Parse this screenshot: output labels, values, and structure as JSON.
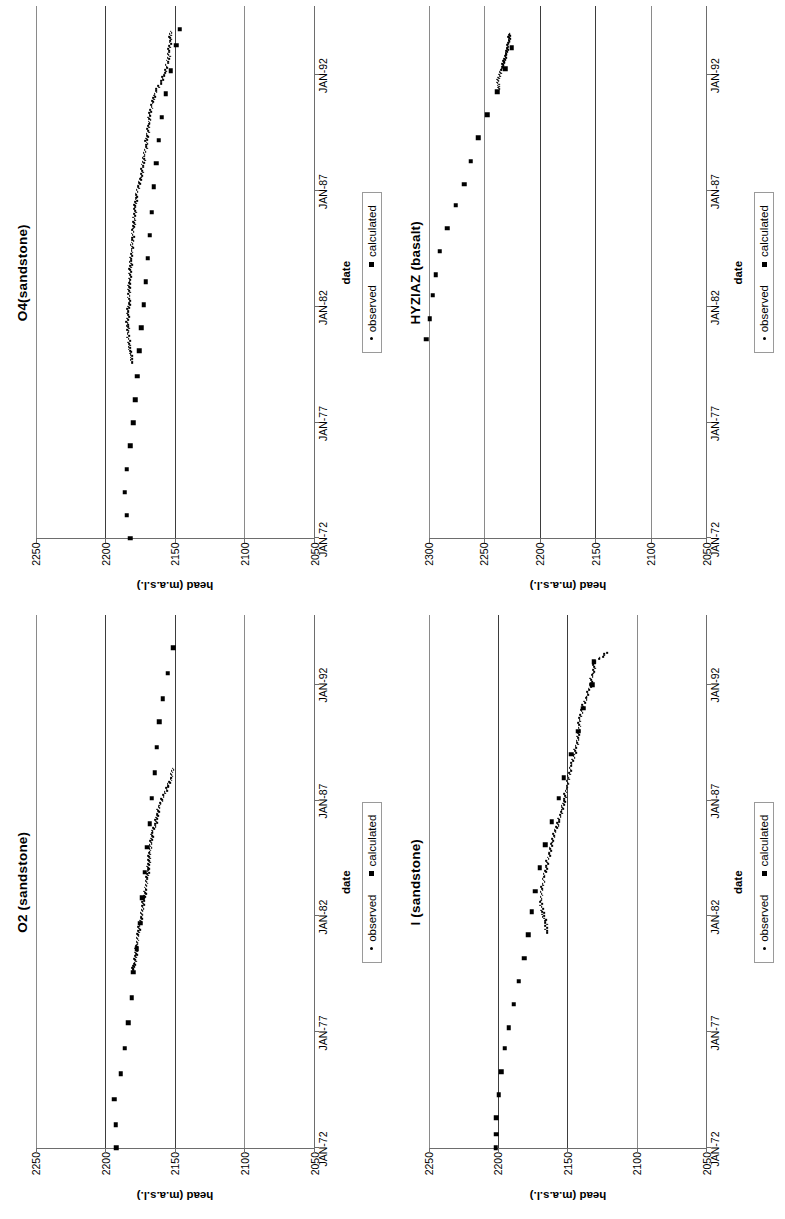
{
  "figure": {
    "panel_order": [
      "O2",
      "I",
      "O4",
      "HYZIAZ"
    ],
    "legend": {
      "observed_label": "observed",
      "calculated_label": "calculated"
    },
    "axis": {
      "xlabel": "date",
      "ylabel": "head (m.a.s.l.)"
    }
  },
  "chart_data": [
    {
      "id": "O2",
      "type": "scatter",
      "title": "O2 (sandstone)",
      "xlabel": "date",
      "ylabel": "head (m.a.s.l.)",
      "xticklabels": [
        "JAN-72",
        "JAN-77",
        "JAN-82",
        "JAN-87",
        "JAN-92"
      ],
      "xtickvalues": [
        1972,
        1977,
        1982,
        1987,
        1992
      ],
      "xlim": [
        1972,
        1995
      ],
      "yticklabels": [
        "2050",
        "2100",
        "2150",
        "2200",
        "2250"
      ],
      "ylim": [
        2050,
        2250
      ],
      "grid": "horizontal",
      "legend_position": "bottom",
      "series": [
        {
          "name": "calculated",
          "marker": "square",
          "x": [
            1972.0,
            1973.0,
            1974.1,
            1975.2,
            1976.3,
            1977.4,
            1978.5,
            1979.6,
            1980.6,
            1981.7,
            1982.8,
            1983.9,
            1985.0,
            1986.0,
            1987.1,
            1988.2,
            1989.3,
            1990.4,
            1991.4,
            1992.5,
            1993.6
          ],
          "y": [
            2192.0,
            2192.5,
            2193.5,
            2189.0,
            2186.0,
            2183.5,
            2181.0,
            2180.0,
            2177.5,
            2175.0,
            2173.5,
            2171.5,
            2170.0,
            2168.0,
            2166.5,
            2164.5,
            2163.0,
            2161.0,
            2158.5,
            2155.0,
            2151.0
          ]
        },
        {
          "name": "observed",
          "marker": "dot",
          "x": [
            1979.7,
            1980.0,
            1980.4,
            1980.8,
            1981.2,
            1981.6,
            1982.0,
            1982.4,
            1982.8,
            1983.2,
            1983.6,
            1984.0,
            1984.4,
            1984.8,
            1985.2,
            1985.6,
            1986.0,
            1986.4,
            1986.8,
            1987.2,
            1987.6,
            1988.0,
            1988.4
          ],
          "y": [
            2180.0,
            2179.0,
            2178.0,
            2177.2,
            2176.4,
            2175.2,
            2174.2,
            2173.2,
            2172.0,
            2171.0,
            2170.0,
            2169.4,
            2168.6,
            2168.0,
            2167.0,
            2166.2,
            2164.0,
            2162.5,
            2161.0,
            2158.0,
            2155.0,
            2152.5,
            2151.5
          ]
        }
      ]
    },
    {
      "id": "I",
      "type": "scatter",
      "title": "I (sandstone)",
      "xlabel": "date",
      "ylabel": "head (m.a.s.l.)",
      "xticklabels": [
        "JAN-72",
        "JAN-77",
        "JAN-82",
        "JAN-87",
        "JAN-92"
      ],
      "xtickvalues": [
        1972,
        1977,
        1982,
        1987,
        1992
      ],
      "xlim": [
        1972,
        1995
      ],
      "yticklabels": [
        "2050",
        "2100",
        "2150",
        "2200",
        "2250"
      ],
      "ylim": [
        2050,
        2250
      ],
      "grid": "horizontal",
      "legend_position": "bottom",
      "series": [
        {
          "name": "calculated",
          "marker": "square",
          "x": [
            1972.0,
            1972.6,
            1973.3,
            1974.3,
            1975.3,
            1976.3,
            1977.2,
            1978.2,
            1979.2,
            1980.2,
            1981.2,
            1982.2,
            1983.1,
            1984.1,
            1985.1,
            1986.1,
            1987.1,
            1988.0,
            1989.0,
            1990.0,
            1991.0,
            1992.0,
            1993.0
          ],
          "y": [
            2201.5,
            2201.0,
            2201.0,
            2199.5,
            2197.5,
            2195.0,
            2192.0,
            2188.5,
            2185.0,
            2181.0,
            2178.0,
            2175.5,
            2173.0,
            2170.0,
            2166.0,
            2161.0,
            2156.0,
            2152.5,
            2147.0,
            2142.0,
            2138.5,
            2132.0,
            2131.0
          ]
        },
        {
          "name": "observed",
          "marker": "dot",
          "x": [
            1981.3,
            1981.8,
            1982.2,
            1982.7,
            1983.2,
            1983.7,
            1984.2,
            1984.7,
            1985.2,
            1985.7,
            1986.1,
            1986.6,
            1987.0,
            1987.5,
            1988.0,
            1988.5,
            1989.0,
            1989.5,
            1990.0,
            1990.5,
            1991.0,
            1991.5,
            1992.0,
            1992.5,
            1993.0,
            1993.4
          ],
          "y": [
            2164.5,
            2166.0,
            2168.0,
            2169.0,
            2168.0,
            2166.5,
            2165.0,
            2163.0,
            2161.0,
            2158.5,
            2156.0,
            2154.0,
            2152.0,
            2150.5,
            2149.0,
            2147.0,
            2145.0,
            2143.0,
            2141.5,
            2141.0,
            2139.0,
            2136.0,
            2133.5,
            2131.5,
            2130.0,
            2121.0
          ]
        }
      ]
    },
    {
      "id": "O4",
      "type": "scatter",
      "title": "O4(sandstone)",
      "xlabel": "date",
      "ylabel": "head (m.a.s.l.)",
      "xticklabels": [
        "JAN-72",
        "JAN-77",
        "JAN-82",
        "JAN-87",
        "JAN-92"
      ],
      "xtickvalues": [
        1972,
        1977,
        1982,
        1987,
        1992
      ],
      "xlim": [
        1972,
        1995
      ],
      "yticklabels": [
        "2050",
        "2100",
        "2150",
        "2200",
        "2250"
      ],
      "ylim": [
        2050,
        2250
      ],
      "grid": "horizontal",
      "legend_position": "bottom",
      "series": [
        {
          "name": "calculated",
          "marker": "square",
          "x": [
            1972.0,
            1973.0,
            1974.0,
            1975.0,
            1976.0,
            1977.0,
            1978.0,
            1979.0,
            1980.1,
            1981.1,
            1982.1,
            1983.1,
            1984.1,
            1985.1,
            1986.1,
            1987.2,
            1988.2,
            1989.2,
            1990.2,
            1991.2,
            1992.2,
            1993.3,
            1994.0
          ],
          "y": [
            2182.0,
            2184.5,
            2186.0,
            2184.5,
            2182.0,
            2180.0,
            2178.5,
            2177.0,
            2175.5,
            2174.0,
            2172.5,
            2171.0,
            2169.5,
            2168.0,
            2166.5,
            2165.0,
            2163.5,
            2161.5,
            2159.5,
            2156.5,
            2153.0,
            2149.0,
            2146.5
          ]
        },
        {
          "name": "observed",
          "marker": "dot",
          "x": [
            1979.6,
            1980.0,
            1980.4,
            1980.9,
            1981.3,
            1981.8,
            1982.2,
            1982.7,
            1983.1,
            1983.6,
            1984.0,
            1984.5,
            1984.9,
            1985.4,
            1985.8,
            1986.3,
            1986.7,
            1987.2,
            1987.6,
            1988.1,
            1988.5,
            1989.0,
            1989.4,
            1989.9,
            1990.3,
            1990.8,
            1991.2,
            1991.7,
            1992.1,
            1992.6,
            1993.0,
            1993.5,
            1993.9
          ],
          "y": [
            2180.5,
            2182.0,
            2183.0,
            2183.5,
            2184.0,
            2183.5,
            2183.0,
            2183.0,
            2182.5,
            2182.0,
            2181.5,
            2181.0,
            2180.5,
            2180.0,
            2179.0,
            2178.5,
            2178.0,
            2176.5,
            2174.0,
            2173.0,
            2172.0,
            2170.5,
            2170.0,
            2168.5,
            2168.0,
            2166.0,
            2164.5,
            2160.0,
            2157.0,
            2155.0,
            2154.0,
            2153.5,
            2153.0
          ]
        }
      ]
    },
    {
      "id": "HYZIAZ",
      "type": "scatter",
      "title": "HYZIAZ (basalt)",
      "xlabel": "date",
      "ylabel": "head (m.a.s.l.)",
      "xticklabels": [
        "JAN-72",
        "JAN-77",
        "JAN-82",
        "JAN-87",
        "JAN-92"
      ],
      "xtickvalues": [
        1972,
        1977,
        1982,
        1987,
        1992
      ],
      "xlim": [
        1972,
        1995
      ],
      "yticklabels": [
        "2050",
        "2100",
        "2150",
        "2200",
        "2250",
        "2300"
      ],
      "ylim": [
        2050,
        2300
      ],
      "grid": "horizontal",
      "legend_position": "bottom",
      "series": [
        {
          "name": "calculated",
          "marker": "square",
          "x": [
            1980.6,
            1981.5,
            1982.5,
            1983.4,
            1984.4,
            1985.4,
            1986.4,
            1987.3,
            1988.3,
            1989.3,
            1990.3,
            1991.3,
            1992.3,
            1993.2
          ],
          "y": [
            2302.0,
            2299.0,
            2296.0,
            2293.5,
            2290.0,
            2283.0,
            2275.5,
            2268.0,
            2262.0,
            2255.0,
            2247.0,
            2238.0,
            2231.0,
            2225.0
          ]
        },
        {
          "name": "observed",
          "marker": "dot",
          "x": [
            1991.4,
            1991.7,
            1992.0,
            1992.3,
            1992.6,
            1992.9,
            1993.2,
            1993.5,
            1993.8
          ],
          "y": [
            2236.0,
            2238.0,
            2236.0,
            2234.0,
            2232.0,
            2230.0,
            2229.0,
            2227.5,
            2227.0
          ]
        }
      ]
    }
  ]
}
